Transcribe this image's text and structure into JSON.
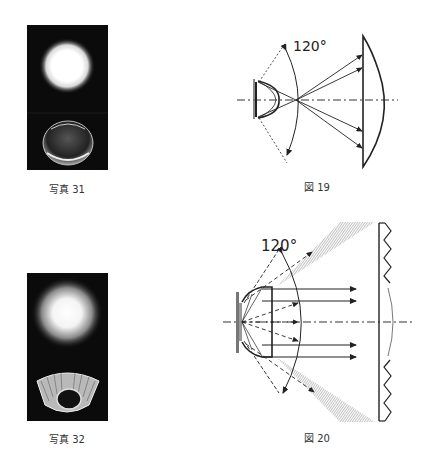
{
  "photos": [
    {
      "id": "photo-31",
      "caption": "写真 31",
      "subject": "spot light above a clear dome lens"
    },
    {
      "id": "photo-32",
      "caption": "写真 32",
      "subject": "diffuse light spot above a faceted reflector cup"
    }
  ],
  "figures": [
    {
      "id": "fig-19",
      "caption": "図 19",
      "angle_label": "120°",
      "description": "LED with dome lens; rays cross on axis and hit a plano-convex lens"
    },
    {
      "id": "fig-20",
      "caption": "図 20",
      "angle_label": "120°",
      "description": "LED with collimating lens; parallel rays toward a Fresnel lens, hatched side cones"
    }
  ],
  "colors": {
    "line": "#222222",
    "hatch": "#999999",
    "photo_bg": "#0b0b0b",
    "led_plate": "#777777"
  }
}
